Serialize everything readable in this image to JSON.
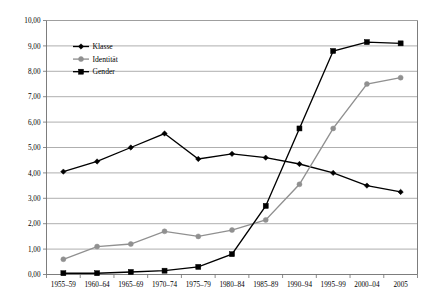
{
  "chart_data": {
    "type": "line",
    "title": "",
    "subtitle": "",
    "xlabel": "",
    "ylabel": "",
    "ylim": [
      0,
      10
    ],
    "ytick_step": 1,
    "grid": true,
    "legend_position": "top-left-inside",
    "decimal_separator": ",",
    "categories": [
      "1955–59",
      "1960–64",
      "1965–69",
      "1970–74",
      "1975–79",
      "1980–84",
      "1985–89",
      "1990–94",
      "1995–99",
      "2000–04",
      "2005"
    ],
    "ytick_labels": [
      "10,00",
      "9,00",
      "8,00",
      "7,00",
      "6,00",
      "5,00",
      "4,00",
      "3,00",
      "2,00",
      "1,00",
      "0,00"
    ],
    "ytick_values": [
      10,
      9,
      8,
      7,
      6,
      5,
      4,
      3,
      2,
      1,
      0
    ],
    "series": [
      {
        "name": "Klasse",
        "color": "#000000",
        "marker": "diamond",
        "values": [
          4.05,
          4.45,
          5.0,
          5.55,
          4.55,
          4.75,
          4.6,
          4.35,
          4.0,
          3.5,
          3.25
        ]
      },
      {
        "name": "Identität",
        "color": "#909090",
        "marker": "circle",
        "values": [
          0.6,
          1.1,
          1.2,
          1.7,
          1.5,
          1.75,
          2.15,
          3.55,
          5.75,
          7.5,
          7.75
        ]
      },
      {
        "name": "Gender",
        "color": "#000000",
        "marker": "square",
        "values": [
          0.05,
          0.05,
          0.1,
          0.15,
          0.3,
          0.8,
          2.7,
          5.75,
          8.8,
          9.15,
          9.1
        ]
      }
    ],
    "legend": [
      {
        "label": "Klasse",
        "color": "#000000",
        "marker": "diamond"
      },
      {
        "label": "Identität",
        "color": "#909090",
        "marker": "circle"
      },
      {
        "label": "Gender",
        "color": "#000000",
        "marker": "square"
      }
    ],
    "colors": {
      "klasse": "#000000",
      "identitaet": "#909090",
      "gender": "#000000",
      "gridline": "#9a9a9a",
      "axis": "#6e6e6e",
      "background": "#ffffff"
    }
  }
}
